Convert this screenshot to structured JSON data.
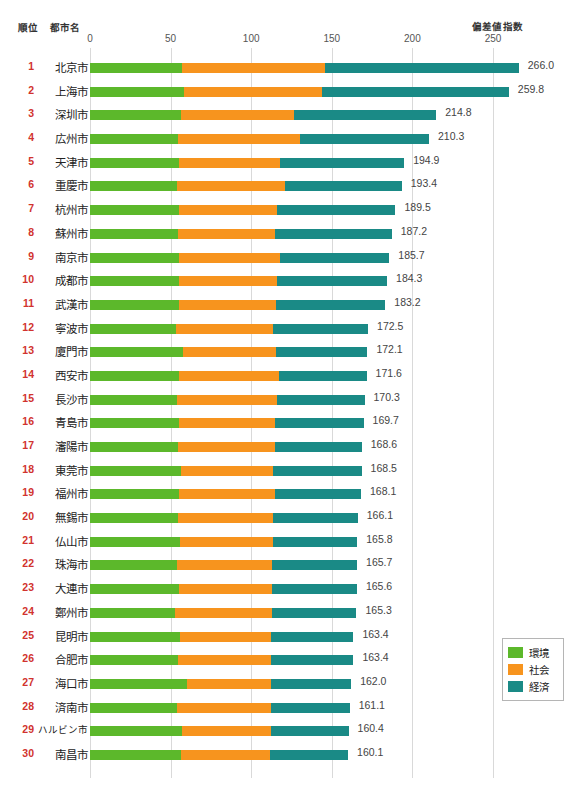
{
  "header": {
    "rank_label": "順位",
    "city_label": "都市名",
    "index_label": "偏差値指数"
  },
  "legend": {
    "items": [
      {
        "label": "環境",
        "color": "#5cb82b"
      },
      {
        "label": "社会",
        "color": "#f7941e"
      },
      {
        "label": "経済",
        "color": "#1a8a86"
      }
    ]
  },
  "chart_data": {
    "type": "bar",
    "orientation": "horizontal",
    "stacked": true,
    "title": "",
    "xlabel": "偏差値指数",
    "ylabel": "都市名",
    "xlim": [
      0,
      270
    ],
    "ticks": [
      0,
      50,
      100,
      150,
      200,
      250
    ],
    "grid": true,
    "legend_position": "bottom-right",
    "series": [
      {
        "name": "環境",
        "color": "#5cb82b",
        "values": [
          57.0,
          58.3,
          56.5,
          54.5,
          55.0,
          54.0,
          55.5,
          54.5,
          55.0,
          55.0,
          55.0,
          53.5,
          57.5,
          55.0,
          54.0,
          55.5,
          54.5,
          56.5,
          55.5,
          54.5,
          56.0,
          54.0,
          55.5,
          52.5,
          56.0,
          54.5,
          60.0,
          54.0,
          57.0,
          56.5
        ]
      },
      {
        "name": "社会",
        "color": "#f7941e",
        "values": [
          89.0,
          85.5,
          70.0,
          75.5,
          63.0,
          67.0,
          60.5,
          60.0,
          63.0,
          61.0,
          60.5,
          60.0,
          58.0,
          62.0,
          62.0,
          59.0,
          60.5,
          57.0,
          59.5,
          59.0,
          57.5,
          59.0,
          57.5,
          60.5,
          56.0,
          57.5,
          52.0,
          58.5,
          55.0,
          55.0
        ]
      },
      {
        "name": "経済",
        "color": "#1a8a86",
        "values": [
          120.0,
          116.0,
          88.3,
          80.3,
          76.9,
          72.4,
          73.5,
          72.7,
          67.7,
          68.3,
          67.7,
          59.0,
          56.6,
          54.6,
          54.3,
          55.2,
          53.6,
          55.0,
          53.1,
          52.6,
          52.3,
          52.7,
          52.6,
          52.3,
          51.4,
          51.4,
          50.0,
          48.6,
          48.4,
          48.6
        ]
      }
    ],
    "rows": [
      {
        "rank": 1,
        "city": "北京市",
        "total": "266.0"
      },
      {
        "rank": 2,
        "city": "上海市",
        "total": "259.8"
      },
      {
        "rank": 3,
        "city": "深圳市",
        "total": "214.8"
      },
      {
        "rank": 4,
        "city": "広州市",
        "total": "210.3"
      },
      {
        "rank": 5,
        "city": "天津市",
        "total": "194.9"
      },
      {
        "rank": 6,
        "city": "重慶市",
        "total": "193.4"
      },
      {
        "rank": 7,
        "city": "杭州市",
        "total": "189.5"
      },
      {
        "rank": 8,
        "city": "蘇州市",
        "total": "187.2"
      },
      {
        "rank": 9,
        "city": "南京市",
        "total": "185.7"
      },
      {
        "rank": 10,
        "city": "成都市",
        "total": "184.3"
      },
      {
        "rank": 11,
        "city": "武漢市",
        "total": "183.2"
      },
      {
        "rank": 12,
        "city": "寧波市",
        "total": "172.5"
      },
      {
        "rank": 13,
        "city": "廈門市",
        "total": "172.1"
      },
      {
        "rank": 14,
        "city": "西安市",
        "total": "171.6"
      },
      {
        "rank": 15,
        "city": "長沙市",
        "total": "170.3"
      },
      {
        "rank": 16,
        "city": "青島市",
        "total": "169.7"
      },
      {
        "rank": 17,
        "city": "瀋陽市",
        "total": "168.6"
      },
      {
        "rank": 18,
        "city": "東莞市",
        "total": "168.5"
      },
      {
        "rank": 19,
        "city": "福州市",
        "total": "168.1"
      },
      {
        "rank": 20,
        "city": "無錫市",
        "total": "166.1"
      },
      {
        "rank": 21,
        "city": "仏山市",
        "total": "165.8"
      },
      {
        "rank": 22,
        "city": "珠海市",
        "total": "165.7"
      },
      {
        "rank": 23,
        "city": "大連市",
        "total": "165.6"
      },
      {
        "rank": 24,
        "city": "鄭州市",
        "total": "165.3"
      },
      {
        "rank": 25,
        "city": "昆明市",
        "total": "163.4"
      },
      {
        "rank": 26,
        "city": "合肥市",
        "total": "163.4"
      },
      {
        "rank": 27,
        "city": "海口市",
        "total": "162.0"
      },
      {
        "rank": 28,
        "city": "済南市",
        "total": "161.1"
      },
      {
        "rank": 29,
        "city": "ハルビン市",
        "total": "160.4"
      },
      {
        "rank": 30,
        "city": "南昌市",
        "total": "160.1"
      }
    ]
  }
}
